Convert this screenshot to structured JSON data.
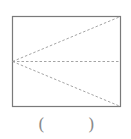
{
  "diagram": {
    "type": "geometry",
    "shape": "rectangle",
    "rect": {
      "x": 12,
      "y": 16,
      "width": 109,
      "height": 91
    },
    "colors": {
      "outline": "#7a7a7a",
      "dashed": "#9a9a9a"
    },
    "dashed_lines": [
      {
        "from": "left-midpoint",
        "to": "top-right-corner"
      },
      {
        "from": "left-midpoint",
        "to": "right-midpoint"
      },
      {
        "from": "left-midpoint",
        "to": "bottom-right-corner"
      }
    ]
  },
  "answer": {
    "open": "(",
    "close": ")",
    "value": ""
  }
}
